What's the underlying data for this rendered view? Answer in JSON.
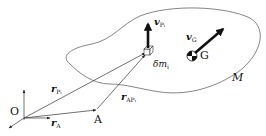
{
  "diagram": {
    "body_label": "M",
    "points": {
      "origin": "O",
      "reference_point": "A",
      "center_of_mass": "G"
    },
    "mass_element": {
      "symbol": "δm",
      "subscript": "i"
    },
    "vectors": {
      "r_Pi": {
        "symbol": "r",
        "subscript": "P",
        "subsub": "i"
      },
      "r_A": {
        "symbol": "r",
        "subscript": "A"
      },
      "r_APi": {
        "symbol": "r",
        "subscript": "AP",
        "subsub": "i"
      },
      "v_Pi": {
        "symbol": "v",
        "subscript": "P",
        "subsub": "i"
      },
      "v_G": {
        "symbol": "v",
        "subscript": "G"
      }
    },
    "colors": {
      "line": "#555555",
      "arrow": "#111111",
      "background": "#ffffff"
    }
  }
}
